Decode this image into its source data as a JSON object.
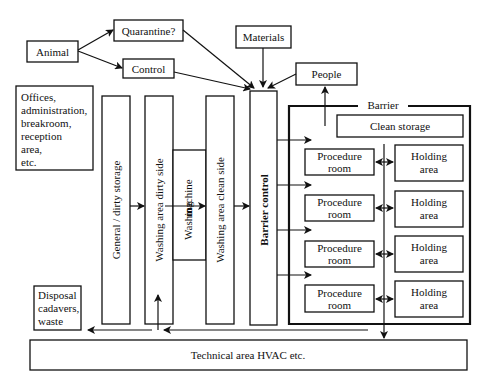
{
  "diagram": {
    "type": "facility-flow-diagram",
    "top_inputs": {
      "animal": "Animal",
      "quarantine": "Quarantine?",
      "control": "Control",
      "materials": "Materials",
      "people": "People"
    },
    "offices": {
      "lines": [
        "Offices,",
        "administration,",
        "breakroom,",
        "reception",
        "area,",
        "etc."
      ]
    },
    "columns": {
      "general_storage": "General / dirty storage",
      "washing_dirty": "Washing area dirty side",
      "washing_machine_1": "Washing",
      "washing_machine_2": "machine",
      "washing_clean": "Washing area clean side",
      "barrier_control": "Barrier control"
    },
    "barrier": {
      "label": "Barrier",
      "clean_storage": "Clean storage",
      "rooms": [
        {
          "procedure_1": "Procedure",
          "procedure_2": "room",
          "holding_1": "Holding",
          "holding_2": "area"
        },
        {
          "procedure_1": "Procedure",
          "procedure_2": "room",
          "holding_1": "Holding",
          "holding_2": "area"
        },
        {
          "procedure_1": "Procedure",
          "procedure_2": "room",
          "holding_1": "Holding",
          "holding_2": "area"
        },
        {
          "procedure_1": "Procedure",
          "procedure_2": "room",
          "holding_1": "Holding",
          "holding_2": "area"
        }
      ]
    },
    "disposal": {
      "lines": [
        "Disposal",
        "cadavers,",
        "waste"
      ]
    },
    "technical_area": "Technical area HVAC etc."
  }
}
